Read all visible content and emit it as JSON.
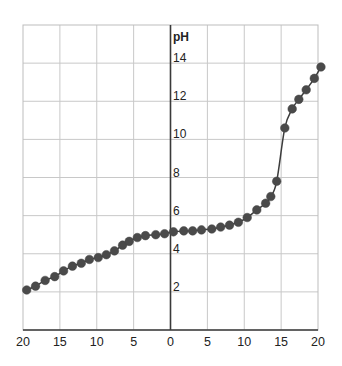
{
  "chart_data": {
    "type": "scatter",
    "title": "",
    "xlabel": "",
    "ylabel": "pH",
    "xlim": [
      -20,
      20
    ],
    "ylim": [
      0,
      16
    ],
    "grid": true,
    "x_ticks": [
      -20,
      -15,
      -10,
      -5,
      0,
      5,
      10,
      15,
      20
    ],
    "x_tick_labels": [
      "20",
      "15",
      "10",
      "5",
      "0",
      "5",
      "10",
      "15",
      "20"
    ],
    "y_ticks": [
      2,
      4,
      6,
      8,
      10,
      12,
      14
    ],
    "y_tick_labels": [
      "2",
      "4",
      "6",
      "8",
      "10",
      "12",
      "14"
    ],
    "y_gridlines": [
      2,
      4,
      6,
      8,
      10,
      12,
      14
    ],
    "x_gridlines": [
      -15,
      -10,
      -5,
      0,
      5,
      10,
      15
    ],
    "connect_with_curve": true,
    "series": [
      {
        "name": "pH",
        "color": "#4a4a4a",
        "points": [
          {
            "x": -19.5,
            "y": 2.1
          },
          {
            "x": -18.3,
            "y": 2.3
          },
          {
            "x": -17.0,
            "y": 2.6
          },
          {
            "x": -15.7,
            "y": 2.8
          },
          {
            "x": -14.5,
            "y": 3.1
          },
          {
            "x": -13.3,
            "y": 3.35
          },
          {
            "x": -12.1,
            "y": 3.5
          },
          {
            "x": -11.0,
            "y": 3.7
          },
          {
            "x": -9.8,
            "y": 3.8
          },
          {
            "x": -8.7,
            "y": 3.95
          },
          {
            "x": -7.6,
            "y": 4.15
          },
          {
            "x": -6.5,
            "y": 4.45
          },
          {
            "x": -5.6,
            "y": 4.65
          },
          {
            "x": -4.5,
            "y": 4.85
          },
          {
            "x": -3.4,
            "y": 4.95
          },
          {
            "x": -2.0,
            "y": 5.0
          },
          {
            "x": -0.8,
            "y": 5.05
          },
          {
            "x": 0.4,
            "y": 5.15
          },
          {
            "x": 1.8,
            "y": 5.2
          },
          {
            "x": 3.0,
            "y": 5.2
          },
          {
            "x": 4.2,
            "y": 5.25
          },
          {
            "x": 5.6,
            "y": 5.3
          },
          {
            "x": 6.8,
            "y": 5.4
          },
          {
            "x": 8.0,
            "y": 5.5
          },
          {
            "x": 9.2,
            "y": 5.65
          },
          {
            "x": 10.4,
            "y": 5.9
          },
          {
            "x": 11.7,
            "y": 6.3
          },
          {
            "x": 12.9,
            "y": 6.65
          },
          {
            "x": 13.6,
            "y": 7.0
          },
          {
            "x": 14.4,
            "y": 7.8
          },
          {
            "x": 15.5,
            "y": 10.6
          },
          {
            "x": 16.5,
            "y": 11.6
          },
          {
            "x": 17.4,
            "y": 12.1
          },
          {
            "x": 18.4,
            "y": 12.6
          },
          {
            "x": 19.5,
            "y": 13.2
          },
          {
            "x": 20.4,
            "y": 13.8
          }
        ]
      }
    ]
  }
}
